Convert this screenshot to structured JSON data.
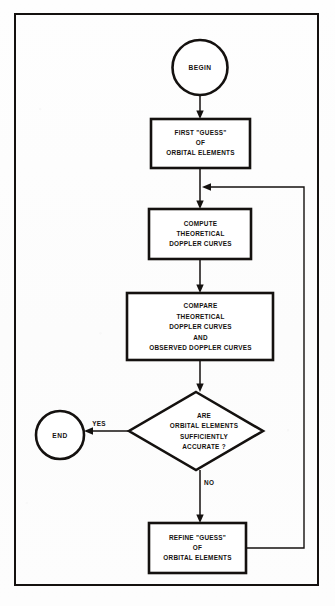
{
  "figure": {
    "type": "flowchart",
    "title_visible": false,
    "border": {
      "color": "#14110f"
    },
    "background_color": "#fdfdfd",
    "line_color": "#14110f"
  },
  "nodes": {
    "begin": {
      "kind": "terminal",
      "label": "BEGIN"
    },
    "first_guess": {
      "kind": "process",
      "lines": [
        "FIRST \"GUESS\"",
        "OF",
        "ORBITAL ELEMENTS"
      ]
    },
    "compute": {
      "kind": "process",
      "lines": [
        "COMPUTE",
        "THEORETICAL",
        "DOPPLER CURVES"
      ]
    },
    "compare": {
      "kind": "process",
      "lines": [
        "COMPARE",
        "THEORETICAL",
        "DOPPLER CURVES",
        "AND",
        "OBSERVED DOPPLER CURVES"
      ]
    },
    "decision": {
      "kind": "decision",
      "lines": [
        "ARE",
        "ORBITAL ELEMENTS",
        "SUFFICIENTLY",
        "ACCURATE ?"
      ]
    },
    "end": {
      "kind": "terminal",
      "label": "END"
    },
    "refine": {
      "kind": "process",
      "lines": [
        "REFINE \"GUESS\"",
        "OF",
        "ORBITAL ELEMENTS"
      ]
    }
  },
  "edge_labels": {
    "yes": "YES",
    "no": "NO"
  },
  "edges": [
    {
      "from": "begin",
      "to": "first_guess",
      "label": ""
    },
    {
      "from": "first_guess",
      "to": "compute",
      "label": ""
    },
    {
      "from": "compute",
      "to": "compare",
      "label": ""
    },
    {
      "from": "compare",
      "to": "decision",
      "label": ""
    },
    {
      "from": "decision",
      "to": "end",
      "label": "YES"
    },
    {
      "from": "decision",
      "to": "refine",
      "label": "NO"
    },
    {
      "from": "refine",
      "to": "compute",
      "label": ""
    }
  ]
}
